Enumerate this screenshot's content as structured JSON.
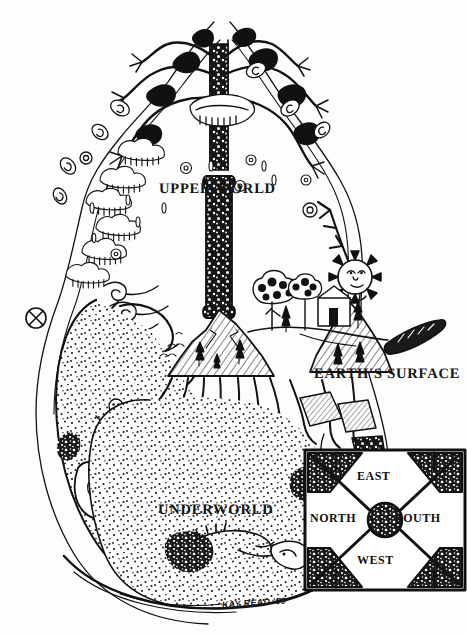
{
  "figure": {
    "medium": "pen-and-ink line drawing",
    "labels": {
      "upper_world": "UPPER WORLD",
      "earths_surface": "EARTH'S SURFACE",
      "underworld": "UNDERWORLD"
    },
    "signature": "KAY READ '00",
    "colors": {
      "ink": "#111111",
      "paper": "#fdfdfc"
    }
  },
  "compass_inset": {
    "top": "EAST",
    "left": "NORTH",
    "right": "SOUTH",
    "bottom": "WEST"
  }
}
